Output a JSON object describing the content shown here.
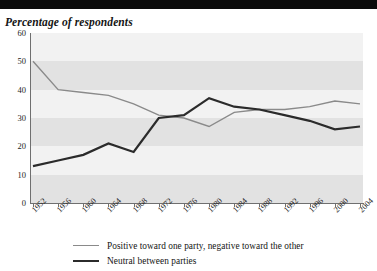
{
  "chart_data": {
    "type": "line",
    "title": "Percentage of respondents",
    "xlabel": "",
    "ylabel": "",
    "ylim": [
      0,
      60
    ],
    "ytick_step": 10,
    "grid": "horizontal-alternating-bands",
    "legend_position": "bottom",
    "x": [
      1952,
      1956,
      1960,
      1964,
      1968,
      1972,
      1976,
      1980,
      1984,
      1988,
      1992,
      1996,
      2000,
      2004
    ],
    "xticklabels": [
      "1952",
      "1956",
      "1960",
      "1964",
      "1968",
      "1972",
      "1976",
      "1980",
      "1984",
      "1988",
      "1992",
      "1996",
      "2000",
      "2004"
    ],
    "yticklabels": [
      "0",
      "10",
      "20",
      "30",
      "40",
      "50",
      "60"
    ],
    "series": [
      {
        "name": "Positive toward one party, negative toward the other",
        "color": "#8a8a8a",
        "width": 1.4,
        "values": [
          50,
          40,
          39,
          38,
          35,
          31,
          30,
          27,
          32,
          33,
          33,
          34,
          36,
          35
        ]
      },
      {
        "name": "Neutral between parties",
        "color": "#2b2b2b",
        "width": 2.2,
        "values": [
          13,
          15,
          17,
          21,
          18,
          30,
          31,
          37,
          34,
          33,
          31,
          29,
          26,
          27
        ]
      }
    ]
  },
  "legend": {
    "items": [
      {
        "label": "Positive toward one party, negative toward the other",
        "color": "#8a8a8a",
        "thick": false
      },
      {
        "label": "Neutral between parties",
        "color": "#2b2b2b",
        "thick": true
      }
    ]
  }
}
